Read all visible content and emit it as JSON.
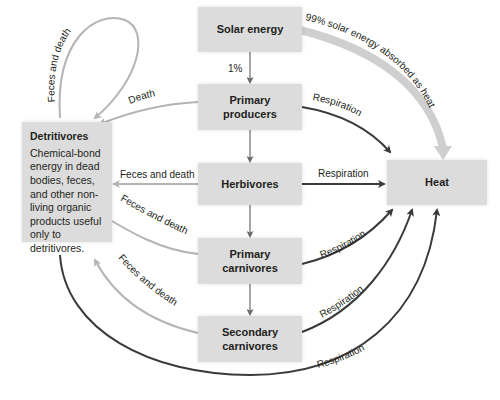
{
  "diagram": {
    "type": "energy-flow",
    "nodes": {
      "solar": "Solar energy",
      "producers": "Primary producers",
      "herbivores": "Herbivores",
      "primary_carnivores": "Primary carnivores",
      "secondary_carnivores": "Secondary carnivores",
      "heat": "Heat",
      "detritivores_title": "Detritivores",
      "detritivores_desc": "Chemical-bond energy in dead bodies, feces, and other non-living organic products useful only to detritivores."
    },
    "node_lines": {
      "producers": [
        "Primary",
        "producers"
      ],
      "primary_carnivores": [
        "Primary",
        "carnivores"
      ],
      "secondary_carnivores": [
        "Secondary",
        "carnivores"
      ]
    },
    "edge_labels": {
      "solar_to_producers": "1%",
      "solar_to_heat": "99% solar energy absorbed as heat",
      "detritivores_loop": "Feces and death",
      "producers_to_detritivores": "Death",
      "herbivores_to_detritivores": "Feces and death",
      "primary_carnivores_to_detritivores": "Feces and death",
      "secondary_carnivores_to_detritivores": "Feces and death",
      "producers_to_heat": "Respiration",
      "herbivores_to_heat": "Respiration",
      "primary_carnivores_to_heat": "Respiration",
      "secondary_carnivores_to_heat": "Respiration",
      "detritivores_to_heat": "Respiration"
    },
    "colors": {
      "box": "#dcdcdc",
      "dark_arrow": "#3a3a3a",
      "light_arrow": "#b4b4b4",
      "solar_heat_arrow": "#cfcfcf"
    }
  }
}
